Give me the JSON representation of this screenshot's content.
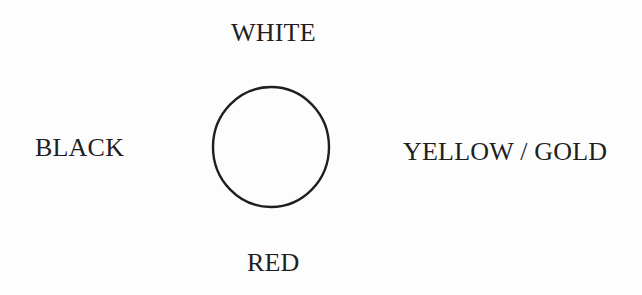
{
  "diagram": {
    "center_shape": "circle",
    "labels": {
      "top": "WHITE",
      "left": "BLACK",
      "right": "YELLOW / GOLD",
      "bottom": "RED"
    },
    "colors": {
      "background": "#fdfdfd",
      "ink": "#1f1f1f"
    }
  }
}
